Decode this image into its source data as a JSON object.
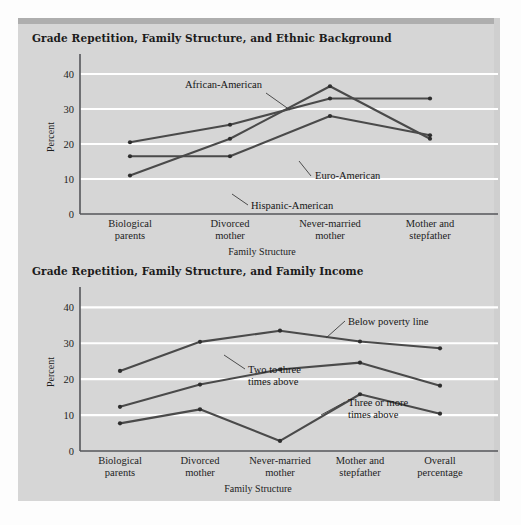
{
  "figure": {
    "background_color": "#d6d6d6",
    "page_color": "#fdfdfd",
    "line_color": "#4a4a4a",
    "gridline_color": "#ffffff",
    "axis_color": "#55565a"
  },
  "charts": [
    {
      "id": "ethnic-background",
      "title": "Grade Repetition, Family Structure, and Ethnic Background",
      "chart_data": {
        "type": "line",
        "title": "Grade Repetition, Family Structure, and Ethnic Background",
        "xlabel": "Family Structure",
        "ylabel": "Percent",
        "ylim": [
          0,
          44
        ],
        "yticks": [
          0,
          10,
          20,
          30,
          40
        ],
        "ytick_labels": [
          "0",
          "10",
          "20",
          "30",
          "40"
        ],
        "grid": true,
        "legend": "annotated-inline",
        "categories": [
          "Biological\nparents",
          "Divorced\nmother",
          "Never-married\nmother",
          "Mother and\nstepfather"
        ],
        "category_lines": [
          [
            "Biological",
            "parents"
          ],
          [
            "Divorced",
            "mother"
          ],
          [
            "Never-married",
            "mother"
          ],
          [
            "Mother and",
            "stepfather"
          ]
        ],
        "series": [
          {
            "name": "African-American",
            "values": [
              11,
              21.5,
              36.5,
              21.5
            ]
          },
          {
            "name": "Euro-American",
            "values": [
              16.5,
              16.5,
              28,
              22.5
            ]
          },
          {
            "name": "Hispanic-American",
            "values": [
              20.5,
              25.5,
              33,
              33
            ]
          }
        ],
        "annotations": [
          {
            "label": "African-American",
            "target_series": "African-American"
          },
          {
            "label": "Euro-American",
            "target_series": "Euro-American"
          },
          {
            "label": "Hispanic-American",
            "target_series": "Hispanic-American"
          }
        ]
      }
    },
    {
      "id": "family-income",
      "title": "Grade Repetition, Family Structure, and Family Income",
      "chart_data": {
        "type": "line",
        "title": "Grade Repetition, Family Structure, and Family Income",
        "xlabel": "Family Structure",
        "ylabel": "Percent",
        "ylim": [
          0,
          44
        ],
        "yticks": [
          0,
          10,
          20,
          30,
          40
        ],
        "ytick_labels": [
          "0",
          "10",
          "20",
          "30",
          "40"
        ],
        "grid": true,
        "legend": "annotated-inline",
        "categories": [
          "Biological\nparents",
          "Divorced\nmother",
          "Never-married\nmother",
          "Mother and\nstepfather",
          "Overall\npercentage"
        ],
        "category_lines": [
          [
            "Biological",
            "parents"
          ],
          [
            "Divorced",
            "mother"
          ],
          [
            "Never-married",
            "mother"
          ],
          [
            "Mother and",
            "stepfather"
          ],
          [
            "Overall",
            "percentage"
          ]
        ],
        "series": [
          {
            "name": "Below poverty line",
            "values": [
              22.3,
              30.4,
              33.5,
              30.5,
              28.6
            ]
          },
          {
            "name": "Two to three times above",
            "values": [
              12.3,
              18.5,
              22.7,
              24.6,
              18.2
            ]
          },
          {
            "name": "Three or more times above",
            "values": [
              7.7,
              11.6,
              2.8,
              15.8,
              10.4
            ]
          }
        ],
        "annotations": [
          {
            "label_lines": [
              "Below poverty line"
            ],
            "target_series": "Below poverty line"
          },
          {
            "label_lines": [
              "Two to three",
              "times above"
            ],
            "target_series": "Two to three times above"
          },
          {
            "label_lines": [
              "Three or more",
              "times above"
            ],
            "target_series": "Three or more times above"
          }
        ]
      }
    }
  ]
}
